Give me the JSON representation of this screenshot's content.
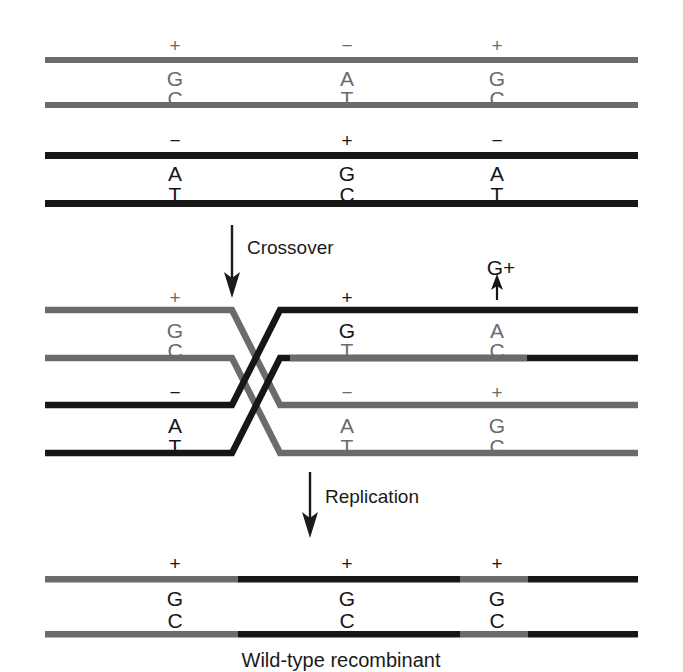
{
  "figure": {
    "caption": "Wild-type recombinant",
    "colors": {
      "gray_strand": "#6b6b6b",
      "black_strand": "#161616",
      "background": "#ffffff",
      "text": "#1a1a1a"
    }
  },
  "steps": [
    {
      "key": "crossover",
      "label": "Crossover"
    },
    {
      "key": "replication",
      "label": "Replication"
    }
  ],
  "annotation": {
    "mismatch_callout": "G+"
  },
  "duplex_top_gray": {
    "name": "parental-duplex-gray",
    "sites": [
      {
        "sign": "+",
        "top_base": "G",
        "bottom_base": "C"
      },
      {
        "sign": "−",
        "top_base": "A",
        "bottom_base": "T"
      },
      {
        "sign": "+",
        "top_base": "G",
        "bottom_base": "C"
      }
    ]
  },
  "duplex_top_black": {
    "name": "parental-duplex-black",
    "sites": [
      {
        "sign": "−",
        "top_base": "A",
        "bottom_base": "T"
      },
      {
        "sign": "+",
        "top_base": "G",
        "bottom_base": "C"
      },
      {
        "sign": "−",
        "top_base": "A",
        "bottom_base": "T"
      }
    ]
  },
  "heteroduplex_upper": {
    "name": "heteroduplex-upper",
    "left_site": {
      "sign": "+",
      "top_base": "G",
      "bottom_base": "C"
    },
    "mid_site": {
      "sign": "+",
      "top_base": "G",
      "bottom_base": "T"
    },
    "right_site": {
      "sign": "",
      "top_base": "A",
      "bottom_base": "C"
    }
  },
  "heteroduplex_lower": {
    "name": "heteroduplex-lower",
    "left_site": {
      "sign": "−",
      "top_base": "A",
      "bottom_base": "T"
    },
    "mid_site": {
      "sign": "−",
      "top_base": "A",
      "bottom_base": "T"
    },
    "right_site": {
      "sign": "+",
      "top_base": "G",
      "bottom_base": "C"
    }
  },
  "duplex_recombinant": {
    "name": "recombinant-duplex",
    "sites": [
      {
        "sign": "+",
        "top_base": "G",
        "bottom_base": "C"
      },
      {
        "sign": "+",
        "top_base": "G",
        "bottom_base": "C"
      },
      {
        "sign": "+",
        "top_base": "G",
        "bottom_base": "C"
      }
    ]
  }
}
